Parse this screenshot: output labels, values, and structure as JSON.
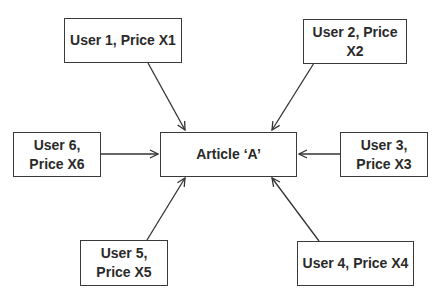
{
  "diagram": {
    "type": "hub-and-spoke",
    "colors": {
      "line": "#333333",
      "border": "#3a3a3a",
      "text": "#2a2a2a",
      "background": "#ffffff"
    },
    "center": {
      "id": "article",
      "label": "Article ‘A’"
    },
    "nodes": [
      {
        "id": "user1",
        "line1": "User 1, Price X1",
        "line2": ""
      },
      {
        "id": "user2",
        "line1": "User 2, Price",
        "line2": "X2"
      },
      {
        "id": "user3",
        "line1": "User 3,",
        "line2": "Price X3"
      },
      {
        "id": "user4",
        "line1": "User 4, Price X4",
        "line2": ""
      },
      {
        "id": "user5",
        "line1": "User 5,",
        "line2": "Price X5"
      },
      {
        "id": "user6",
        "line1": "User 6,",
        "line2": "Price X6"
      }
    ],
    "edges": [
      {
        "from": "user1",
        "to": "article"
      },
      {
        "from": "user2",
        "to": "article"
      },
      {
        "from": "user3",
        "to": "article"
      },
      {
        "from": "user4",
        "to": "article"
      },
      {
        "from": "user5",
        "to": "article"
      },
      {
        "from": "user6",
        "to": "article"
      }
    ]
  }
}
